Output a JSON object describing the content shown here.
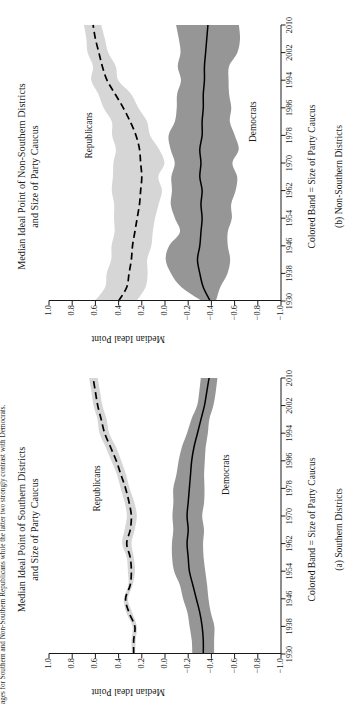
{
  "figure": {
    "top_caption": "ages for Southern and Non-Southern Republicans while the latter two strongly contrast with Democrats.",
    "y_axis_title": "Median Ideal Point",
    "band_note": "Colored Band = Size of Party Caucus",
    "series_label_republicans": "Republicans",
    "series_label_democrats": "Democrats",
    "colors": {
      "republican_band": "#d6d6d6",
      "democrat_band": "#969696",
      "line": "#000000",
      "axis": "#1a1a1a",
      "background": "#ffffff"
    }
  },
  "panels": [
    {
      "id": "panel-a",
      "title_line1": "Median Ideal Point of Southern Districts",
      "title_line2": "and Size of Party Caucus",
      "subcaption": "(a) Southern Districts"
    },
    {
      "id": "panel-b",
      "title_line1": "Median Ideal Point of Non-Southern Districts",
      "title_line2": "and Size of Party Caucus",
      "subcaption": "(b) Non-Southern Districts"
    }
  ],
  "chart_data": [
    {
      "type": "area",
      "panel": "a",
      "title": "Median Ideal Point of Southern Districts and Size of Party Caucus",
      "subtitle": "(a) Southern Districts",
      "xlabel": "Colored Band = Size of Party Caucus",
      "ylabel": "Median Ideal Point",
      "xlim": [
        1930,
        2010
      ],
      "ylim": [
        -1.0,
        1.0
      ],
      "xticks": [
        1930,
        1938,
        1946,
        1954,
        1962,
        1970,
        1978,
        1986,
        1994,
        2002,
        2010
      ],
      "yticks": [
        1.0,
        0.8,
        0.6,
        0.4,
        0.2,
        0.0,
        -0.2,
        -0.4,
        -0.6,
        -0.8,
        -1.0
      ],
      "grid": false,
      "legend": "inline-labels",
      "x": [
        1930,
        1934,
        1938,
        1942,
        1946,
        1950,
        1954,
        1958,
        1962,
        1966,
        1970,
        1974,
        1978,
        1982,
        1986,
        1990,
        1994,
        1998,
        2002,
        2006,
        2010
      ],
      "series": [
        {
          "name": "Republicans",
          "line_style": "dashed",
          "band_color": "#d6d6d6",
          "values": [
            0.27,
            0.27,
            0.26,
            0.31,
            0.34,
            0.3,
            0.29,
            0.3,
            0.33,
            0.3,
            0.29,
            0.31,
            0.34,
            0.38,
            0.42,
            0.47,
            0.52,
            0.55,
            0.58,
            0.6,
            0.62
          ],
          "band_lower": [
            0.25,
            0.25,
            0.24,
            0.29,
            0.32,
            0.28,
            0.26,
            0.27,
            0.29,
            0.26,
            0.25,
            0.27,
            0.3,
            0.34,
            0.38,
            0.43,
            0.48,
            0.51,
            0.54,
            0.56,
            0.58
          ],
          "band_upper": [
            0.29,
            0.29,
            0.28,
            0.33,
            0.36,
            0.32,
            0.32,
            0.33,
            0.37,
            0.34,
            0.33,
            0.35,
            0.38,
            0.42,
            0.46,
            0.51,
            0.56,
            0.59,
            0.62,
            0.64,
            0.66
          ]
        },
        {
          "name": "Democrats",
          "line_style": "solid",
          "band_color": "#969696",
          "values": [
            -0.33,
            -0.33,
            -0.32,
            -0.3,
            -0.27,
            -0.24,
            -0.21,
            -0.2,
            -0.19,
            -0.2,
            -0.19,
            -0.2,
            -0.21,
            -0.22,
            -0.23,
            -0.25,
            -0.28,
            -0.31,
            -0.34,
            -0.36,
            -0.38
          ],
          "band_lower": [
            -0.43,
            -0.43,
            -0.42,
            -0.4,
            -0.38,
            -0.36,
            -0.34,
            -0.33,
            -0.32,
            -0.33,
            -0.32,
            -0.33,
            -0.34,
            -0.34,
            -0.34,
            -0.35,
            -0.37,
            -0.39,
            -0.41,
            -0.43,
            -0.45
          ],
          "band_upper": [
            -0.23,
            -0.23,
            -0.22,
            -0.2,
            -0.16,
            -0.12,
            -0.08,
            -0.07,
            -0.06,
            -0.07,
            -0.06,
            -0.07,
            -0.08,
            -0.1,
            -0.12,
            -0.15,
            -0.19,
            -0.23,
            -0.27,
            -0.29,
            -0.31
          ]
        }
      ]
    },
    {
      "type": "area",
      "panel": "b",
      "title": "Median Ideal Point of Non-Southern Districts and Size of Party Caucus",
      "subtitle": "(b) Non-Southern Districts",
      "xlabel": "Colored Band = Size of Party Caucus",
      "ylabel": "Median Ideal Point",
      "xlim": [
        1930,
        2010
      ],
      "ylim": [
        -1.0,
        1.0
      ],
      "xticks": [
        1930,
        1938,
        1946,
        1954,
        1962,
        1970,
        1978,
        1986,
        1994,
        2002,
        2010
      ],
      "yticks": [
        1.0,
        0.8,
        0.6,
        0.4,
        0.2,
        0.0,
        -0.2,
        -0.4,
        -0.6,
        -0.8,
        -1.0
      ],
      "grid": false,
      "legend": "inline-labels",
      "x": [
        1930,
        1934,
        1938,
        1942,
        1946,
        1950,
        1954,
        1958,
        1962,
        1966,
        1970,
        1974,
        1978,
        1982,
        1986,
        1990,
        1994,
        1998,
        2002,
        2006,
        2010
      ],
      "series": [
        {
          "name": "Republicans",
          "line_style": "dashed",
          "band_color": "#d6d6d6",
          "values": [
            0.4,
            0.33,
            0.31,
            0.29,
            0.28,
            0.26,
            0.24,
            0.22,
            0.21,
            0.2,
            0.21,
            0.22,
            0.25,
            0.3,
            0.36,
            0.43,
            0.5,
            0.54,
            0.57,
            0.6,
            0.62
          ],
          "band_lower": [
            0.22,
            0.16,
            0.14,
            0.18,
            0.12,
            0.11,
            0.09,
            0.06,
            0.03,
            0.05,
            0.03,
            0.07,
            0.11,
            0.17,
            0.24,
            0.32,
            0.4,
            0.45,
            0.49,
            0.52,
            0.55
          ],
          "band_upper": [
            0.62,
            0.52,
            0.5,
            0.45,
            0.48,
            0.45,
            0.44,
            0.44,
            0.46,
            0.42,
            0.45,
            0.43,
            0.45,
            0.48,
            0.52,
            0.57,
            0.62,
            0.65,
            0.68,
            0.7,
            0.72
          ]
        },
        {
          "name": "Democrats",
          "line_style": "solid",
          "band_color": "#969696",
          "values": [
            -0.39,
            -0.33,
            -0.3,
            -0.28,
            -0.3,
            -0.31,
            -0.32,
            -0.31,
            -0.32,
            -0.3,
            -0.31,
            -0.3,
            -0.32,
            -0.32,
            -0.33,
            -0.33,
            -0.34,
            -0.34,
            -0.35,
            -0.36,
            -0.37
          ],
          "band_lower": [
            -0.46,
            -0.5,
            -0.52,
            -0.58,
            -0.56,
            -0.53,
            -0.55,
            -0.56,
            -0.58,
            -0.6,
            -0.58,
            -0.61,
            -0.6,
            -0.57,
            -0.56,
            -0.55,
            -0.55,
            -0.58,
            -0.6,
            -0.62,
            -0.63
          ],
          "band_upper": [
            -0.3,
            -0.14,
            -0.08,
            -0.03,
            -0.05,
            -0.1,
            -0.09,
            -0.08,
            -0.06,
            -0.05,
            -0.07,
            -0.04,
            -0.06,
            -0.09,
            -0.11,
            -0.12,
            -0.14,
            -0.12,
            -0.11,
            -0.1,
            -0.1
          ]
        }
      ]
    }
  ]
}
